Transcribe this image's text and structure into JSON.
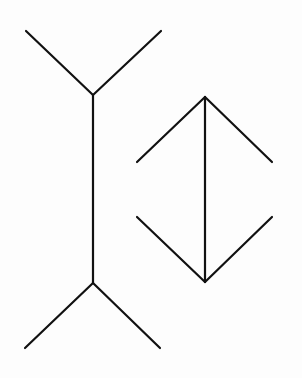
{
  "diagram": {
    "title": "",
    "stroke_color": "#111111",
    "background": "#fdfdfd",
    "figures": [
      {
        "name": "outward-fins-figure",
        "shaft": {
          "x1": 93,
          "y1": 95,
          "x2": 93,
          "y2": 283
        },
        "fins": [
          {
            "x1": 93,
            "y1": 95,
            "x2": 26,
            "y2": 31
          },
          {
            "x1": 93,
            "y1": 95,
            "x2": 161,
            "y2": 31
          },
          {
            "x1": 93,
            "y1": 283,
            "x2": 25,
            "y2": 348
          },
          {
            "x1": 93,
            "y1": 283,
            "x2": 160,
            "y2": 348
          }
        ]
      },
      {
        "name": "inward-fins-figure",
        "shaft": {
          "x1": 205,
          "y1": 97,
          "x2": 205,
          "y2": 282
        },
        "fins": [
          {
            "x1": 205,
            "y1": 97,
            "x2": 137,
            "y2": 162
          },
          {
            "x1": 205,
            "y1": 97,
            "x2": 272,
            "y2": 162
          },
          {
            "x1": 205,
            "y1": 282,
            "x2": 137,
            "y2": 217
          },
          {
            "x1": 205,
            "y1": 282,
            "x2": 272,
            "y2": 217
          }
        ]
      }
    ]
  }
}
